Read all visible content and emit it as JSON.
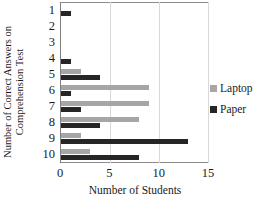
{
  "chart_data": {
    "type": "bar",
    "orientation": "horizontal",
    "title": "",
    "xlabel": "Number of Students",
    "ylabel": "Number of Correct Answers on Comprehension Test",
    "categories": [
      "1",
      "2",
      "3",
      "4",
      "5",
      "6",
      "7",
      "8",
      "9",
      "10"
    ],
    "series": [
      {
        "name": "Laptop",
        "color": "#a6a6a6",
        "values": [
          0,
          0,
          0,
          0,
          2,
          9,
          9,
          8,
          2,
          3
        ]
      },
      {
        "name": "Paper",
        "color": "#262626",
        "values": [
          1,
          0,
          0,
          1,
          4,
          1,
          2,
          4,
          13,
          8
        ]
      }
    ],
    "xlim": [
      0,
      15
    ],
    "xticks": [
      "0",
      "5",
      "10",
      "15"
    ],
    "xtick_values": [
      0,
      5,
      10,
      15
    ],
    "gridlines": "vertical",
    "legend_position": "right"
  }
}
